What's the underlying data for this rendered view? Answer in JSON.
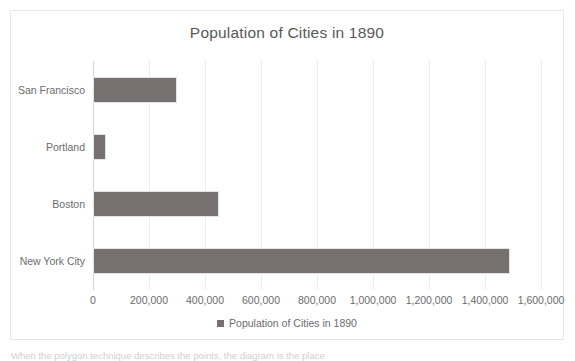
{
  "chart_data": {
    "type": "bar",
    "orientation": "horizontal",
    "title": "Population of Cities in 1890",
    "xlabel": "",
    "ylabel": "",
    "categories": [
      "San Francisco",
      "Portland",
      "Boston",
      "New York City"
    ],
    "values": [
      298997,
      46385,
      448477,
      1489000
    ],
    "series": [
      {
        "name": "Population of Cities in 1890",
        "values": [
          298997,
          46385,
          448477,
          1489000
        ],
        "color": "#767070"
      }
    ],
    "xlim": [
      0,
      1600000
    ],
    "xticks": [
      0,
      200000,
      400000,
      600000,
      800000,
      1000000,
      1200000,
      1400000,
      1600000
    ],
    "xtick_labels": [
      "0",
      "200,000",
      "400,000",
      "600,000",
      "800,000",
      "1,000,000",
      "1,200,000",
      "1,400,000",
      "1,600,000"
    ],
    "grid": true,
    "grid_axis": "x",
    "legend": {
      "position": "bottom",
      "entries": [
        "Population of Cities in 1890"
      ]
    }
  },
  "caption": {
    "text": "When the polygon technique describes the points, the diagram is the place"
  },
  "colors": {
    "bar": "#767070",
    "gridline": "#eceaea",
    "frame_border": "#e8e8e8",
    "text": "#6b6b6b",
    "title_text": "#585858",
    "background": "#ffffff"
  }
}
